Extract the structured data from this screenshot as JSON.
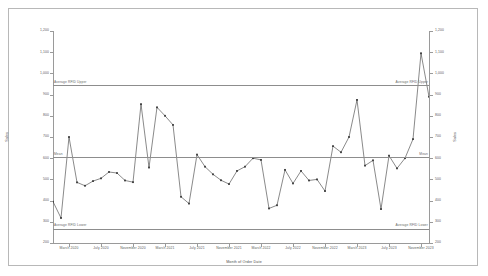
{
  "chart_data": {
    "type": "line",
    "title": "",
    "xlabel": "Month of Order Date",
    "ylabel": "Sales",
    "ylabel_right": "Sales",
    "ylim": [
      200,
      1200
    ],
    "grid": false,
    "legend_position": "none",
    "marker": "square",
    "line_color": "#3a3a3a",
    "reference_line_color": "#8d8d8d",
    "axis_color": "#9a9a9a",
    "ytick_values": [
      1200,
      1100,
      1000,
      900,
      800,
      700,
      600,
      500,
      400,
      300,
      200
    ],
    "ytick_labels": [
      "1,200",
      "1,100",
      "1,000",
      "900",
      "800",
      "700",
      "600",
      "500",
      "400",
      "300",
      "200"
    ],
    "ytick_labels_right": [
      "1,200",
      "1,100",
      "1,000",
      "900",
      "800",
      "700",
      "600",
      "500",
      "400",
      "300",
      "200"
    ],
    "reference_lines": [
      {
        "name": "average-rfid-upper",
        "label_left": "Average RFID Upper",
        "label_right": "Average RFID Upper",
        "value": 943
      },
      {
        "name": "mean",
        "label_left": "Mean",
        "label_right": "Mean",
        "value": 604
      },
      {
        "name": "average-rfid-lower",
        "label_left": "Average RFID Lower",
        "label_right": "Average RFID Lower",
        "value": 266
      }
    ],
    "xtick_labels": [
      "March 2020",
      "July 2020",
      "November 2020",
      "March 2021",
      "July 2021",
      "November 2021",
      "March 2022",
      "July 2022",
      "November 2022",
      "March 2023",
      "July 2023",
      "November 2023"
    ],
    "xtick_positions": [
      2,
      6,
      10,
      14,
      18,
      22,
      26,
      30,
      34,
      38,
      42,
      46
    ],
    "x": [
      "January 2020",
      "February 2020",
      "March 2020",
      "April 2020",
      "May 2020",
      "June 2020",
      "July 2020",
      "August 2020",
      "September 2020",
      "October 2020",
      "November 2020",
      "December 2020",
      "January 2021",
      "February 2021",
      "March 2021",
      "April 2021",
      "May 2021",
      "June 2021",
      "July 2021",
      "August 2021",
      "September 2021",
      "October 2021",
      "November 2021",
      "December 2021",
      "January 2022",
      "February 2022",
      "March 2022",
      "April 2022",
      "May 2022",
      "June 2022",
      "July 2022",
      "August 2022",
      "September 2022",
      "October 2022",
      "November 2022",
      "December 2022",
      "January 2023",
      "February 2023",
      "March 2023",
      "April 2023",
      "May 2023",
      "June 2023",
      "July 2023",
      "August 2023",
      "September 2023",
      "October 2023",
      "November 2023",
      "December 2023"
    ],
    "values": [
      395,
      318,
      700,
      486,
      470,
      492,
      505,
      535,
      530,
      495,
      487,
      855,
      556,
      840,
      800,
      757,
      418,
      386,
      617,
      560,
      524,
      496,
      478,
      540,
      560,
      600,
      592,
      363,
      378,
      545,
      481,
      540,
      495,
      500,
      445,
      657,
      628,
      700,
      875,
      565,
      590,
      360,
      612,
      552,
      600,
      690,
      1095,
      890
    ],
    "n_points": 48
  },
  "top_strip": [
    {
      "text": ""
    },
    {
      "text": ""
    },
    {
      "text": ""
    },
    {
      "text": ""
    },
    {
      "text": ""
    },
    {
      "text": ""
    }
  ]
}
